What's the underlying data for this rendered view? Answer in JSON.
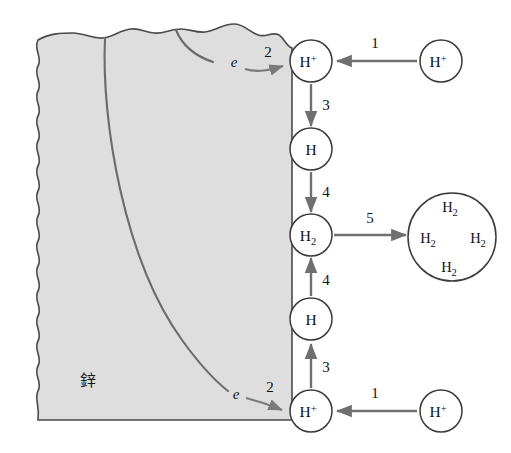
{
  "figure": {
    "background_color": "#ffffff"
  },
  "metal": {
    "label": "鋅",
    "label_meaning": "zinc",
    "fill_color": "#dedede",
    "edge_color": "#4a4a4a",
    "grain_boundary_color": "#6b6b6b"
  },
  "electrons": [
    {
      "symbol": "e",
      "position": "upper"
    },
    {
      "symbol": "e",
      "position": "lower"
    }
  ],
  "steps": [
    {
      "id": "1-top",
      "label": "1",
      "description": "H+ transport to surface (top)"
    },
    {
      "id": "2-top",
      "label": "2",
      "description": "electron transfer (top)"
    },
    {
      "id": "3-top",
      "label": "3",
      "description": "H+ reduced to adsorbed H (top)"
    },
    {
      "id": "4-top",
      "label": "4",
      "description": "H combines to H2 (top)"
    },
    {
      "id": "5",
      "label": "5",
      "description": "H2 escapes as gas bubble"
    },
    {
      "id": "4-bottom",
      "label": "4",
      "description": "H combines to H2 (bottom)"
    },
    {
      "id": "3-bottom",
      "label": "3",
      "description": "H+ reduced to adsorbed H (bottom)"
    },
    {
      "id": "2-bottom",
      "label": "2",
      "description": "electron transfer (bottom)"
    },
    {
      "id": "1-bottom",
      "label": "1",
      "description": "H+ transport to surface (bottom)"
    }
  ],
  "species_nodes": [
    {
      "id": "h-plus-surface-top",
      "base": "H",
      "sup": "+",
      "sub": ""
    },
    {
      "id": "h-atom-top",
      "base": "H",
      "sup": "",
      "sub": ""
    },
    {
      "id": "h2-surface",
      "base": "H",
      "sup": "",
      "sub": "2"
    },
    {
      "id": "h-atom-bottom",
      "base": "H",
      "sup": "",
      "sub": ""
    },
    {
      "id": "h-plus-surface-bottom",
      "base": "H",
      "sup": "+",
      "sub": ""
    },
    {
      "id": "h-plus-solution-top",
      "base": "H",
      "sup": "+",
      "sub": ""
    },
    {
      "id": "h-plus-solution-bottom",
      "base": "H",
      "sup": "+",
      "sub": ""
    }
  ],
  "gas_bubble": {
    "id": "h2-gas-bubble",
    "molecules": [
      {
        "position": "top",
        "base": "H",
        "sub": "2"
      },
      {
        "position": "left",
        "base": "H",
        "sub": "2"
      },
      {
        "position": "right",
        "base": "H",
        "sub": "2"
      },
      {
        "position": "bottom",
        "base": "H",
        "sub": "2"
      }
    ]
  }
}
